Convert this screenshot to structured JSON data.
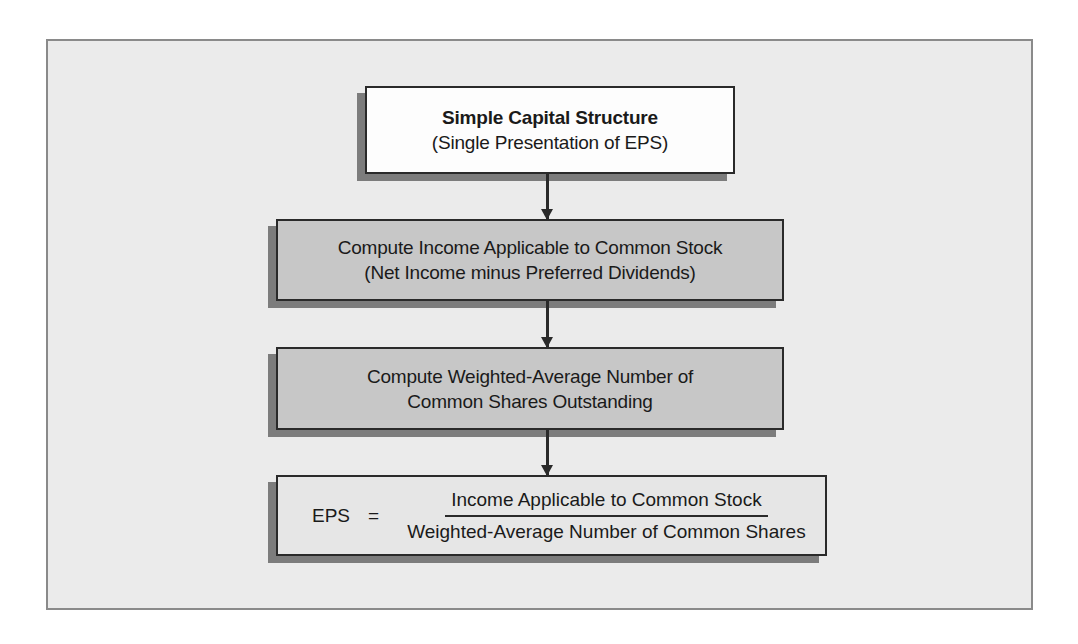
{
  "diagram": {
    "title_box": {
      "title": "Simple Capital Structure",
      "subtitle": "(Single Presentation of EPS)"
    },
    "steps": [
      {
        "line1": "Compute Income Applicable to Common Stock",
        "line2": "(Net Income minus Preferred Dividends)"
      },
      {
        "line1": "Compute Weighted-Average Number of",
        "line2": "Common Shares Outstanding"
      }
    ],
    "formula": {
      "lhs": "EPS",
      "operator": "=",
      "numerator": "Income Applicable to Common Stock",
      "denominator": "Weighted-Average Number of Common Shares"
    },
    "colors": {
      "panel_background": "#ebebeb",
      "panel_border": "#8a8a8a",
      "title_box_fill": "#fdfdfd",
      "step_box_fill": "#c7c7c7",
      "formula_box_fill": "#e6e6e6",
      "box_border": "#2a2a2a",
      "shadow": "#7c7c7c"
    }
  }
}
